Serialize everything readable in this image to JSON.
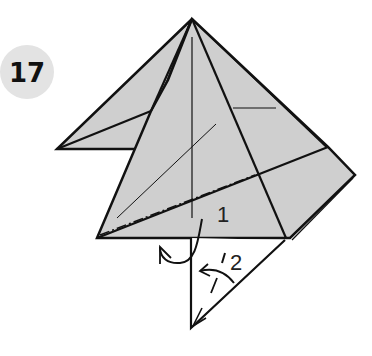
{
  "diagram": {
    "step_badge": {
      "number": "17",
      "circle_color": "#e3e3e3",
      "text_color": "#111111"
    },
    "paper_fill": "#cfcfcf",
    "line_color": "#111111",
    "labels": {
      "step1": "1",
      "step2": "2"
    },
    "annotations": [
      {
        "id": "mountain-fold-line",
        "style": "dash-dot",
        "meaning": "mountain fold"
      },
      {
        "id": "turn-over-arrow",
        "meaning": "fold behind"
      },
      {
        "id": "fold-arrow-2",
        "meaning": "fold up"
      }
    ]
  }
}
